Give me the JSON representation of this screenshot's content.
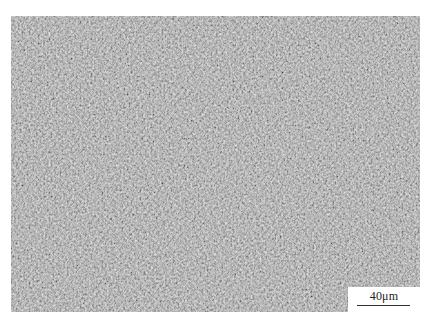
{
  "image": {
    "description": "Optical micrograph of fine acicular/lath microstructure, grayscale",
    "tone": "#b9b9b9"
  },
  "scale_bar": {
    "label": "40μm",
    "line_color": "#333333",
    "background": "#ffffff"
  }
}
